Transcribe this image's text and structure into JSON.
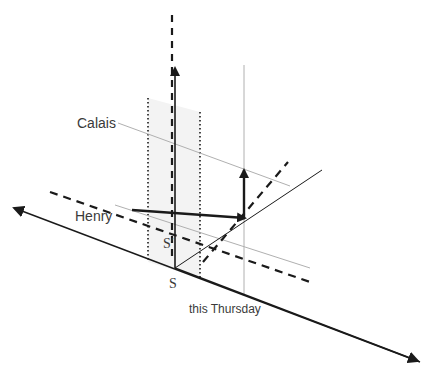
{
  "diagram": {
    "type": "spacetime-axes-sketch",
    "labels": {
      "calais": "Calais",
      "henry": "Henry",
      "s_prime": "S′",
      "s": "S",
      "this_thursday": "this Thursday"
    },
    "colors": {
      "ink": "#1a1a1a",
      "light_line": "#b0b0b0",
      "shade": "#f3f3f3",
      "label": "#3a3a3a"
    }
  }
}
